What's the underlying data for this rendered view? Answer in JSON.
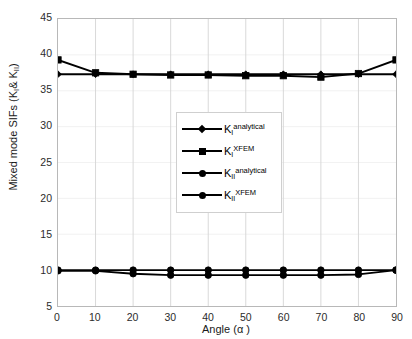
{
  "chart_data": {
    "type": "line",
    "title": "",
    "xlabel": "Angle (α)",
    "ylabel": "Mixed mode SIFs (Kᵢ& Kₗₗ)",
    "ylabel_parts": {
      "prefix": "Mixed mode SIFs (K",
      "sub1": "I",
      "mid": "& K",
      "sub2": "II",
      "suffix": ")"
    },
    "xlabel_parts": {
      "text": "Angle (",
      "symbol": "α",
      "close": ")"
    },
    "x": [
      0,
      10,
      20,
      30,
      40,
      50,
      60,
      70,
      80,
      90
    ],
    "xlim": [
      0,
      90
    ],
    "ylim": [
      5,
      45
    ],
    "xticks": [
      "0",
      "10",
      "20",
      "30",
      "40",
      "50",
      "60",
      "70",
      "80",
      "90"
    ],
    "yticks": [
      "5",
      "10",
      "15",
      "20",
      "25",
      "30",
      "35",
      "40",
      "45"
    ],
    "grid": true,
    "legend_position": "center",
    "series": [
      {
        "name": "K_I^analytical",
        "label_base": "K",
        "label_sub": "I",
        "label_sup": "analytical",
        "marker": "diamond",
        "color": "#000000",
        "values": [
          37.3,
          37.3,
          37.3,
          37.3,
          37.3,
          37.3,
          37.3,
          37.3,
          37.3,
          37.3
        ]
      },
      {
        "name": "K_I^XFEM",
        "label_base": "K",
        "label_sub": "I",
        "label_sup": "XFEM",
        "marker": "square",
        "color": "#000000",
        "values": [
          39.3,
          37.5,
          37.3,
          37.2,
          37.2,
          37.1,
          37.1,
          36.9,
          37.4,
          39.3
        ]
      },
      {
        "name": "K_II^analytical",
        "label_base": "K",
        "label_sub": "II",
        "label_sup": "analytical",
        "marker": "circle",
        "color": "#000000",
        "values": [
          10.0,
          10.0,
          10.0,
          10.0,
          10.0,
          10.0,
          10.0,
          10.0,
          10.0,
          10.0
        ]
      },
      {
        "name": "K_II^XFEM",
        "label_base": "K",
        "label_sub": "II",
        "label_sup": "XFEM",
        "marker": "circle",
        "color": "#000000",
        "values": [
          9.9,
          9.9,
          9.5,
          9.3,
          9.3,
          9.3,
          9.3,
          9.3,
          9.4,
          10.0
        ]
      }
    ]
  },
  "style": {
    "axis_color": "#b8b8b8",
    "grid_color": "#d9d9d9",
    "line_color": "#000000",
    "background": "#ffffff",
    "text_color": "#1a1a1a"
  }
}
